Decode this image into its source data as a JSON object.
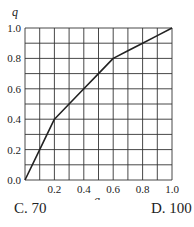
{
  "chart_data": {
    "type": "line",
    "title": "",
    "xlabel": "g",
    "ylabel": "q",
    "xlim": [
      0,
      1.0
    ],
    "ylim": [
      0,
      1.0
    ],
    "grid": true,
    "x_ticks": [
      "0.2",
      "0.4",
      "0.6",
      "0.8",
      "1.0"
    ],
    "y_ticks": [
      "0.0",
      "0.2",
      "0.4",
      "0.6",
      "0.8",
      "1.0"
    ],
    "series": [
      {
        "name": "q vs g",
        "x": [
          0,
          0.1,
          0.2,
          0.3,
          0.4,
          0.5,
          0.6,
          0.7,
          0.8,
          0.9,
          1.0
        ],
        "values": [
          0,
          0.2,
          0.4,
          0.5,
          0.6,
          0.7,
          0.8,
          0.85,
          0.9,
          0.95,
          1.0
        ]
      }
    ]
  },
  "options": {
    "c": "C.  70",
    "d": "D.  100"
  }
}
